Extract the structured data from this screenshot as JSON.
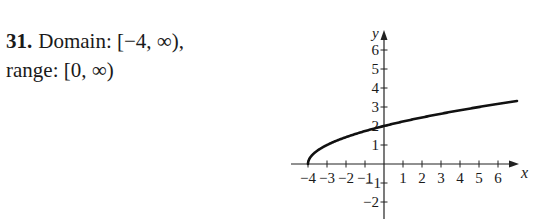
{
  "problem": {
    "number": "31.",
    "line1": "Domain: [−4, ∞),",
    "line2": "range: [0, ∞)"
  },
  "chart_data": {
    "type": "line",
    "title": "",
    "function": "y = sqrt(x + 4)",
    "xlabel": "x",
    "ylabel": "y",
    "xlim": [
      -4.4,
      7
    ],
    "ylim": [
      -2.9,
      7.1
    ],
    "x_ticks": [
      -4,
      -3,
      -2,
      -1,
      1,
      2,
      3,
      4,
      5,
      6
    ],
    "x_tick_labels": [
      "−4",
      "−3",
      "−2",
      "−1",
      "1",
      "2",
      "3",
      "4",
      "5",
      "6"
    ],
    "y_ticks": [
      -2,
      -1,
      1,
      2,
      3,
      4,
      5,
      6
    ],
    "y_tick_labels": [
      "−2",
      "−1",
      "1",
      "2",
      "3",
      "4",
      "5",
      "6"
    ],
    "grid": false,
    "series": [
      {
        "name": "sqrt(x+4)",
        "x": [
          -4,
          -3,
          -2,
          -1,
          0,
          1,
          2,
          3,
          4,
          5,
          6,
          7
        ],
        "y": [
          0,
          1,
          1.41,
          1.73,
          2,
          2.24,
          2.45,
          2.65,
          2.83,
          3,
          3.16,
          3.32
        ]
      }
    ]
  }
}
